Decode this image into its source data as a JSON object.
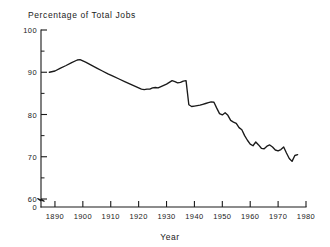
{
  "chart_data": {
    "type": "line",
    "title": "Percentage of Total Jobs",
    "xlabel": "Year",
    "ylabel": "",
    "xlim": [
      1885,
      1980
    ],
    "ylim": [
      60,
      100
    ],
    "y_axis_break": true,
    "y_axis_break_labels": [
      "0",
      "60"
    ],
    "grid": false,
    "legend": "none",
    "x_ticks": [
      1890,
      1900,
      1910,
      1920,
      1930,
      1940,
      1950,
      1960,
      1970,
      1980
    ],
    "x_tick_labels": [
      "1890",
      "1900",
      "1910",
      "1920",
      "1930",
      "1940",
      "1950",
      "1960",
      "1970",
      "1980"
    ],
    "y_ticks": [
      60,
      70,
      80,
      90,
      100
    ],
    "y_tick_labels": [
      "60",
      "70",
      "80",
      "90",
      "100"
    ],
    "y_minor_tick_step": 5,
    "zero_label": "0",
    "series": [
      {
        "name": "Percentage of Total Jobs",
        "color": "#1a1a1a",
        "x": [
          1888,
          1890,
          1892,
          1894,
          1896,
          1898,
          1899,
          1901,
          1903,
          1905,
          1907,
          1909,
          1911,
          1913,
          1915,
          1917,
          1919,
          1920,
          1921,
          1922,
          1923,
          1924,
          1925,
          1926,
          1927,
          1928,
          1929,
          1930,
          1931,
          1932,
          1933,
          1934,
          1935,
          1936,
          1937,
          1938,
          1939,
          1940,
          1941,
          1942,
          1943,
          1944,
          1945,
          1946,
          1947,
          1948,
          1949,
          1950,
          1951,
          1952,
          1953,
          1954,
          1955,
          1956,
          1957,
          1958,
          1959,
          1960,
          1961,
          1962,
          1963,
          1964,
          1965,
          1966,
          1967,
          1968,
          1969,
          1970,
          1971,
          1972,
          1973,
          1974,
          1975,
          1976,
          1977
        ],
        "y": [
          90.0,
          90.3,
          91.0,
          91.6,
          92.3,
          92.9,
          93.0,
          92.4,
          91.7,
          91.0,
          90.3,
          89.6,
          89.0,
          88.4,
          87.8,
          87.2,
          86.6,
          86.3,
          86.0,
          85.9,
          86.0,
          86.0,
          86.3,
          86.4,
          86.3,
          86.6,
          86.9,
          87.2,
          87.6,
          88.0,
          87.8,
          87.5,
          87.6,
          87.9,
          88.0,
          82.3,
          81.9,
          82.0,
          82.1,
          82.2,
          82.4,
          82.6,
          82.8,
          83.0,
          82.9,
          81.5,
          80.2,
          79.9,
          80.4,
          79.8,
          78.6,
          78.2,
          77.9,
          76.9,
          76.4,
          75.0,
          73.9,
          73.0,
          72.6,
          73.5,
          72.8,
          72.0,
          71.9,
          72.5,
          72.8,
          72.3,
          71.6,
          71.4,
          71.7,
          72.3,
          70.9,
          69.6,
          68.9,
          70.3,
          70.5
        ]
      }
    ]
  },
  "labels": {
    "title": "Percentage of Total Jobs",
    "xlabel": "Year"
  }
}
